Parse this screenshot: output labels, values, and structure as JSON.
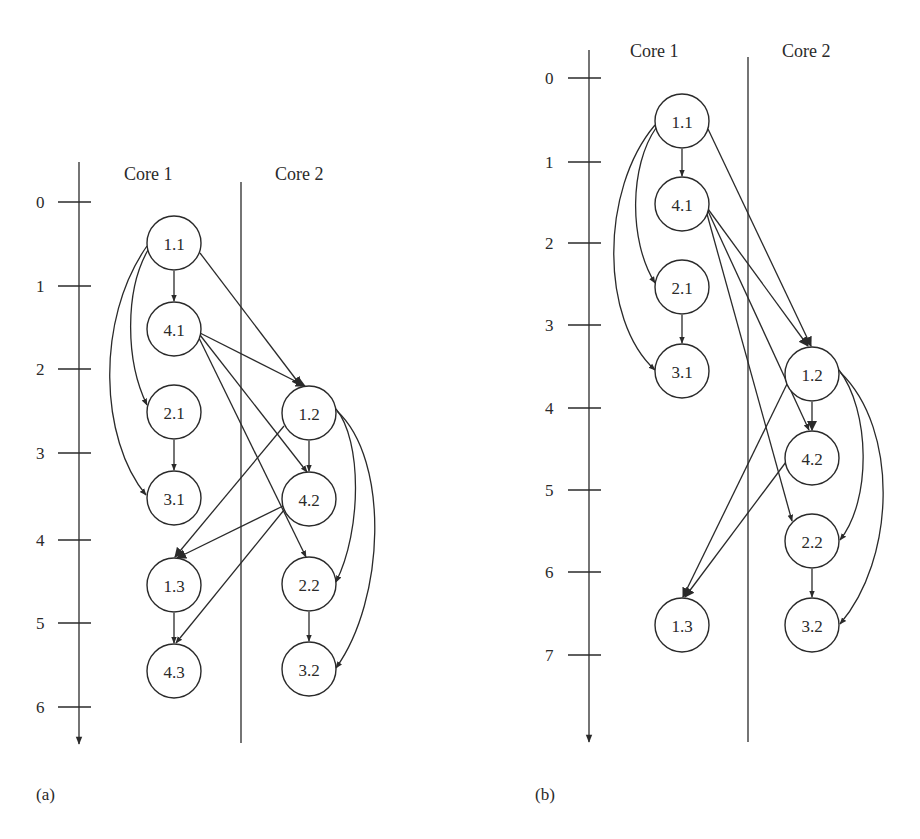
{
  "panels": [
    {
      "caption": "(a)",
      "columns": [
        "Core 1",
        "Core 2"
      ],
      "time_axis_ticks": [
        "0",
        "1",
        "2",
        "3",
        "4",
        "5",
        "6"
      ],
      "nodes": {
        "n11": "1.1",
        "n41": "4.1",
        "n21": "2.1",
        "n31": "3.1",
        "n13": "1.3",
        "n43": "4.3",
        "n12": "1.2",
        "n42": "4.2",
        "n22": "2.2",
        "n32": "3.2"
      },
      "edges": [
        [
          "1.1",
          "4.1"
        ],
        [
          "1.1",
          "2.1"
        ],
        [
          "1.1",
          "3.1"
        ],
        [
          "1.1",
          "1.2"
        ],
        [
          "4.1",
          "1.2"
        ],
        [
          "4.1",
          "4.2"
        ],
        [
          "4.1",
          "2.2"
        ],
        [
          "2.1",
          "3.1"
        ],
        [
          "1.2",
          "4.2"
        ],
        [
          "1.2",
          "1.3"
        ],
        [
          "1.2",
          "2.2"
        ],
        [
          "1.2",
          "3.2"
        ],
        [
          "4.2",
          "1.3"
        ],
        [
          "4.2",
          "4.3"
        ],
        [
          "1.3",
          "4.3"
        ],
        [
          "2.2",
          "3.2"
        ]
      ]
    },
    {
      "caption": "(b)",
      "columns": [
        "Core 1",
        "Core 2"
      ],
      "time_axis_ticks": [
        "0",
        "1",
        "2",
        "3",
        "4",
        "5",
        "6",
        "7"
      ],
      "nodes": {
        "n11": "1.1",
        "n41": "4.1",
        "n21": "2.1",
        "n31": "3.1",
        "n13": "1.3",
        "n12": "1.2",
        "n42": "4.2",
        "n22": "2.2",
        "n32": "3.2"
      },
      "edges": [
        [
          "1.1",
          "4.1"
        ],
        [
          "1.1",
          "2.1"
        ],
        [
          "1.1",
          "3.1"
        ],
        [
          "1.1",
          "1.2"
        ],
        [
          "4.1",
          "1.2"
        ],
        [
          "4.1",
          "4.2"
        ],
        [
          "4.1",
          "2.2"
        ],
        [
          "2.1",
          "3.1"
        ],
        [
          "1.2",
          "4.2"
        ],
        [
          "1.2",
          "1.3"
        ],
        [
          "1.2",
          "2.2"
        ],
        [
          "1.2",
          "3.2"
        ],
        [
          "4.2",
          "1.3"
        ],
        [
          "2.2",
          "3.2"
        ]
      ]
    }
  ]
}
